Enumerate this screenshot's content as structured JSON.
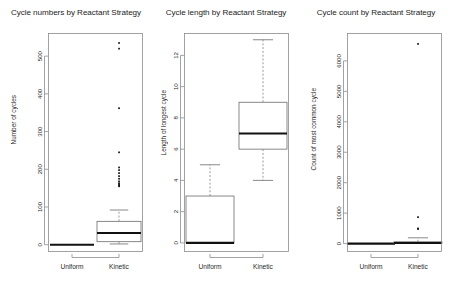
{
  "figure": {
    "background": "#ffffff",
    "panel_count": 3,
    "x_categories": [
      "Uniform",
      "Kinetic"
    ]
  },
  "chart_data": [
    {
      "type": "box",
      "title": "Cycle numbers by Reactant Strategy",
      "xlabel": "",
      "ylabel": "Number of cycles",
      "categories": [
        "Uniform",
        "Kinetic"
      ],
      "ylim": [
        -18,
        560
      ],
      "yticks": [
        0,
        100,
        200,
        300,
        400,
        500
      ],
      "ytick_labels": [
        "0",
        "100",
        "200",
        "300",
        "400",
        "500"
      ],
      "grid": false,
      "legend": "none",
      "boxes": [
        {
          "category": "Uniform",
          "min": 0,
          "q1": 0,
          "median": 0,
          "q3": 0,
          "max": 0,
          "whisker_low": 0,
          "whisker_high": 0,
          "outliers": []
        },
        {
          "category": "Kinetic",
          "q1": 8,
          "median": 31,
          "q3": 62,
          "whisker_low": 2,
          "whisker_high": 92,
          "outliers": [
            155,
            157,
            160,
            163,
            168,
            175,
            182,
            190,
            198,
            205,
            245,
            362,
            520,
            535
          ]
        }
      ]
    },
    {
      "type": "box",
      "title": "Cycle length by Reactant Strategy",
      "xlabel": "",
      "ylabel": "Length of longest cycle",
      "categories": [
        "Uniform",
        "Kinetic"
      ],
      "ylim": [
        -0.55,
        13.4
      ],
      "yticks": [
        0,
        2,
        4,
        6,
        8,
        10,
        12
      ],
      "ytick_labels": [
        "0",
        "2",
        "4",
        "6",
        "8",
        "10",
        "12"
      ],
      "grid": false,
      "legend": "none",
      "boxes": [
        {
          "category": "Uniform",
          "q1": 0,
          "median": 0,
          "q3": 3,
          "whisker_low": 0,
          "whisker_high": 5,
          "outliers": []
        },
        {
          "category": "Kinetic",
          "q1": 6,
          "median": 7,
          "q3": 9,
          "whisker_low": 4,
          "whisker_high": 13,
          "outliers": []
        }
      ]
    },
    {
      "type": "box",
      "title": "Cycle count by Reactant Strategy",
      "xlabel": "",
      "ylabel": "Count of most common cycle",
      "categories": [
        "Uniform",
        "Kinetic"
      ],
      "ylim": [
        -260,
        6900
      ],
      "yticks": [
        0,
        1000,
        2000,
        3000,
        4000,
        5000,
        6000
      ],
      "ytick_labels": [
        "0",
        "1000",
        "2000",
        "3000",
        "4000",
        "5000",
        "6000"
      ],
      "grid": false,
      "legend": "none",
      "boxes": [
        {
          "category": "Uniform",
          "q1": 0,
          "median": 0,
          "q3": 0,
          "whisker_low": 0,
          "whisker_high": 0,
          "outliers": []
        },
        {
          "category": "Kinetic",
          "q1": 0,
          "median": 20,
          "q3": 60,
          "whisker_low": 0,
          "whisker_high": 190,
          "outliers": [
            480,
            500,
            870,
            6560
          ]
        }
      ]
    }
  ]
}
